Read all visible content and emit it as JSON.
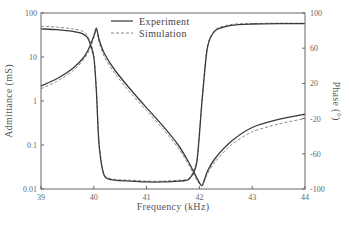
{
  "chart_data": {
    "type": "line",
    "title": "",
    "xlabel": "Frequency (kHz)",
    "ylabel_left": "Admittance (mS)",
    "ylabel_right": "Phase (°)",
    "xlim": [
      39,
      44
    ],
    "ylim_left": [
      0.01,
      100
    ],
    "yscale_left": "log",
    "ylim_right": [
      -100,
      100
    ],
    "x_ticks": [
      "39",
      "40",
      "41",
      "42",
      "43",
      "44"
    ],
    "y_left_ticks": [
      "100",
      "10",
      "1",
      "0.1",
      "0.01"
    ],
    "y_right_ticks": [
      "100",
      "60",
      "20",
      "-20",
      "-60",
      "-100"
    ],
    "grid": false,
    "legend": {
      "position": "upper center",
      "entries": [
        {
          "label": "Experiment",
          "style": "solid"
        },
        {
          "label": "Simulation",
          "style": "dashed"
        }
      ]
    },
    "x": [
      39.0,
      39.3,
      39.6,
      39.8,
      39.9,
      40.0,
      40.05,
      40.1,
      40.2,
      40.4,
      40.7,
      41.0,
      41.3,
      41.6,
      41.8,
      41.95,
      42.05,
      42.15,
      42.3,
      42.6,
      43.0,
      43.5,
      44.0
    ],
    "series": [
      {
        "name": "Admittance - Experiment",
        "axis": "left",
        "style": "solid",
        "values": [
          2.2,
          3.2,
          5.5,
          9.5,
          15,
          30,
          45,
          25,
          12,
          5.0,
          1.8,
          0.7,
          0.28,
          0.1,
          0.04,
          0.018,
          0.012,
          0.025,
          0.05,
          0.12,
          0.25,
          0.38,
          0.5
        ]
      },
      {
        "name": "Admittance - Simulation",
        "axis": "left",
        "style": "dashed",
        "values": [
          1.9,
          2.8,
          4.8,
          8.5,
          13,
          27,
          42,
          22,
          10,
          4.2,
          1.5,
          0.6,
          0.24,
          0.085,
          0.035,
          0.016,
          0.012,
          0.022,
          0.042,
          0.1,
          0.2,
          0.3,
          0.4
        ]
      },
      {
        "name": "Phase - Experiment",
        "axis": "right",
        "style": "solid",
        "values": [
          82,
          81,
          79,
          76,
          70,
          50,
          10,
          -50,
          -85,
          -90,
          -91,
          -92,
          -92,
          -91,
          -89,
          -70,
          0,
          60,
          80,
          86,
          87.5,
          88,
          88
        ]
      },
      {
        "name": "Phase - Simulation",
        "axis": "right",
        "style": "dashed",
        "values": [
          85,
          84,
          82,
          79,
          72,
          52,
          12,
          -48,
          -84,
          -89,
          -90,
          -91,
          -91,
          -90,
          -88,
          -68,
          2,
          62,
          81,
          87,
          88,
          88.5,
          88.5
        ]
      }
    ]
  }
}
